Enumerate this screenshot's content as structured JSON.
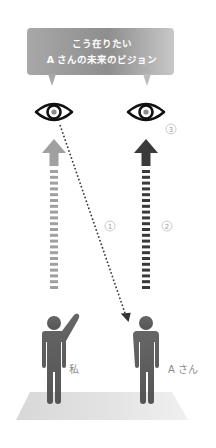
{
  "bubble": {
    "line1": "こう在りたい",
    "line2": "A さんの未来のビジョン"
  },
  "figures": {
    "me_label": "私",
    "a_label": "A さん"
  },
  "markers": {
    "one": "1",
    "two": "2",
    "three": "3"
  },
  "colors": {
    "bubble": "#9a9a9a",
    "arrow_light": "#a0a0a0",
    "arrow_dark": "#3a3a3a",
    "person": "#5e5e5e",
    "floor": "#dcdcdc",
    "eye": "#111111",
    "pupil": "#8a8a8a"
  }
}
